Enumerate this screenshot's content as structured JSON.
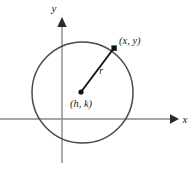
{
  "figure": {
    "axes": {
      "x_axis_label": "x",
      "y_axis_label": "y"
    },
    "labels": {
      "point_on_circle": "(x, y)",
      "center_point": "(h, k)",
      "radius": "r"
    },
    "colors": {
      "circle_stroke": "#4a4a4a",
      "axis_stroke": "#8a8a8a",
      "radius_stroke": "#111111",
      "point_fill": "#111111",
      "text": "#1a1a1a",
      "background": "#ffffff"
    },
    "geometry": {
      "circle_center_px": "82.5, 92.5",
      "circle_radius_px": "50.5",
      "center_dot_px": "81, 92",
      "point_dot_px": "114, 48",
      "x_axis_y_px": "119",
      "y_axis_x_px": "62"
    }
  }
}
